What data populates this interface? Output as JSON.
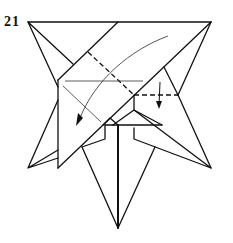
{
  "diagram": {
    "step_number": "21",
    "colors": {
      "line": "#111111",
      "thin_line": "#555555",
      "background": "#ffffff"
    },
    "annotations": [
      {
        "type": "valley-fold-dashed-line",
        "description": "diagonal dashed fold line across front flap"
      },
      {
        "type": "valley-fold-dashed-line",
        "description": "short horizontal dashed line on right"
      },
      {
        "type": "curved-arrow",
        "description": "fold flap down-left along crease"
      },
      {
        "type": "small-arrow",
        "description": "fold small section downward"
      }
    ]
  }
}
